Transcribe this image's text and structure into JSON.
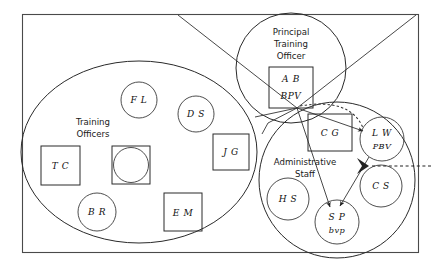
{
  "diagram": {
    "frame": {
      "name": "outer-boundary"
    },
    "groups": [
      {
        "id": "training-officers",
        "label": "Training\nOfficers",
        "label_lines": [
          "Training",
          "Officers"
        ],
        "shape": "ellipse"
      },
      {
        "id": "principal-training-officer",
        "label_lines": [
          "Principal",
          "Training",
          "Officer"
        ],
        "shape": "circle"
      },
      {
        "id": "administrative-staff",
        "label_lines": [
          "Administrative",
          "Staff"
        ],
        "shape": "circle"
      }
    ],
    "nodes": [
      {
        "id": "fl",
        "label": "F L",
        "sub": "",
        "shape": "circle",
        "group": "training-officers"
      },
      {
        "id": "ds",
        "label": "D S",
        "sub": "",
        "shape": "circle",
        "group": "training-officers"
      },
      {
        "id": "jg",
        "label": "J G",
        "sub": "",
        "shape": "square",
        "group": "training-officers"
      },
      {
        "id": "tc",
        "label": "T C",
        "sub": "",
        "shape": "square",
        "group": "training-officers"
      },
      {
        "id": "unlabeled",
        "label": "",
        "sub": "",
        "shape": "square-with-circle",
        "group": "training-officers"
      },
      {
        "id": "br",
        "label": "B R",
        "sub": "",
        "shape": "circle",
        "group": "training-officers"
      },
      {
        "id": "em",
        "label": "E M",
        "sub": "",
        "shape": "square",
        "group": "training-officers"
      },
      {
        "id": "ab",
        "label": "A B",
        "sub": "BPV",
        "shape": "square",
        "group": "principal-training-officer"
      },
      {
        "id": "cg",
        "label": "C G",
        "sub": "",
        "shape": "square",
        "group": "administrative-staff"
      },
      {
        "id": "lw",
        "label": "L W",
        "sub": "PBV",
        "shape": "circle",
        "group": "administrative-staff"
      },
      {
        "id": "cs",
        "label": "C S",
        "sub": "",
        "shape": "circle",
        "group": "administrative-staff"
      },
      {
        "id": "hs",
        "label": "H S",
        "sub": "",
        "shape": "circle",
        "group": "administrative-staff"
      },
      {
        "id": "sp",
        "label": "S P",
        "sub": "bvp",
        "shape": "circle",
        "group": "administrative-staff"
      }
    ],
    "edges": [
      {
        "id": "e1",
        "from": "junction",
        "to": "lw",
        "style": "solid",
        "arrow": true
      },
      {
        "id": "e2",
        "from": "junction",
        "to": "sp",
        "style": "solid",
        "arrow": true
      },
      {
        "id": "e3",
        "from": "lw",
        "to": "sp",
        "style": "solid",
        "arrow": true
      },
      {
        "id": "e4",
        "from": "cs",
        "to": "lw",
        "style": "dashed",
        "arrow": true
      },
      {
        "id": "e5",
        "from": "junction",
        "to": "lw",
        "style": "dotted",
        "arrow": false
      },
      {
        "id": "e6",
        "from": "top-border",
        "to": "junction",
        "style": "solid",
        "arrow": false
      },
      {
        "id": "e7",
        "from": "top-right-corner",
        "to": "junction",
        "style": "solid",
        "arrow": false
      },
      {
        "id": "e8",
        "from": "junction",
        "to": "training-officers",
        "style": "solid",
        "arrow": false
      }
    ]
  }
}
